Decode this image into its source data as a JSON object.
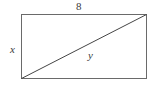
{
  "figure": {
    "kind": "geometry-diagram",
    "background_color": "#ffffff",
    "stroke_color": "#555555",
    "diagonal_color": "#3f3f3f",
    "text_color": "#3a3a3a",
    "shape": {
      "name": "rectangle",
      "left": 21,
      "top": 14,
      "right": 146,
      "bottom": 78,
      "width": 125,
      "height": 64
    },
    "diagonal": {
      "name": "diagonal-line",
      "x1": 21,
      "y1": 78,
      "x2": 146,
      "y2": 14
    },
    "labels": {
      "top": "8",
      "left": "x",
      "diagonal": "y"
    }
  }
}
